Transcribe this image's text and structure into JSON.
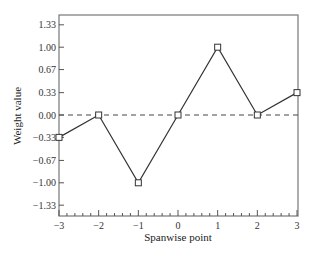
{
  "chart_data": {
    "type": "line",
    "title": "",
    "xlabel": "Spanwise point",
    "ylabel": "Weight value",
    "x": [
      -3,
      -2,
      -1,
      0,
      1,
      2,
      3
    ],
    "series": [
      {
        "name": "Weight",
        "values": [
          -0.33,
          0.0,
          -1.0,
          0.0,
          1.0,
          0.0,
          0.33
        ],
        "marker": "square",
        "color": "#333333"
      }
    ],
    "xlim": [
      -3,
      3
    ],
    "ylim": [
      -1.5,
      1.48
    ],
    "xticks": [
      "-3",
      "-2",
      "-1",
      "0",
      "1",
      "2",
      "3"
    ],
    "yticks": [
      "1.33",
      "1.00",
      "0.67",
      "0.33",
      "0.00",
      "-0.33",
      "-0.67",
      "-1.00",
      "-1.33"
    ],
    "ytick_values": [
      1.33,
      1.0,
      0.67,
      0.33,
      0.0,
      -0.33,
      -0.67,
      -1.0,
      -1.33
    ],
    "x_minor_ticks_per_major": 4,
    "reference_line": {
      "y": 0,
      "style": "dashed"
    },
    "grid": false,
    "legend": null
  }
}
